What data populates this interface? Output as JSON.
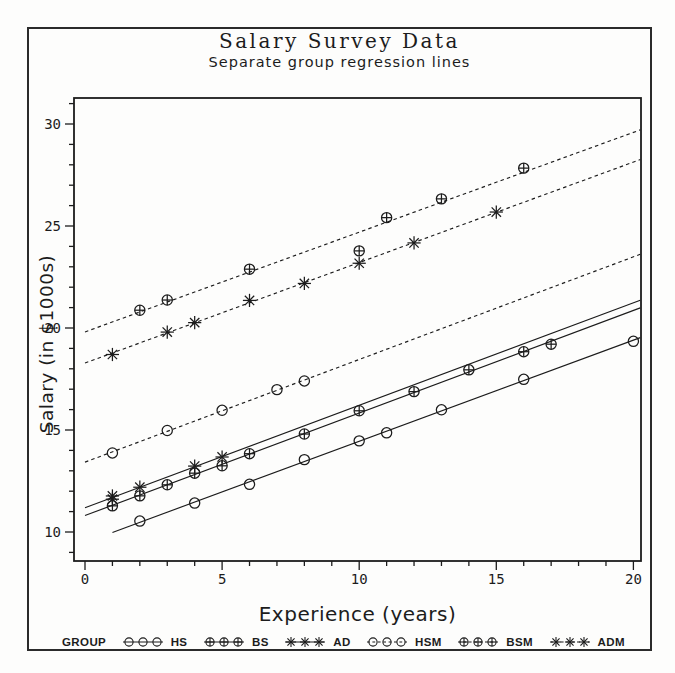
{
  "chart_data": {
    "type": "scatter",
    "title": "Salary Survey Data",
    "subtitle": "Separate group regression lines",
    "xlabel": "Experience (years)",
    "ylabel": "Salary (in $1000s)",
    "xlim": [
      -0.4,
      20.3
    ],
    "ylim": [
      8.6,
      31.3
    ],
    "x_ticks": [
      0,
      5,
      10,
      15,
      20
    ],
    "y_ticks": [
      10,
      15,
      20,
      25,
      30
    ],
    "minor_tick_interval": 1,
    "grid": "off",
    "line_color": "#1c1c1c",
    "series": [
      {
        "name": "HS",
        "marker": "circle",
        "line": "solid",
        "points": [
          [
            2,
            10.535
          ],
          [
            4,
            11.417
          ],
          [
            6,
            12.336
          ],
          [
            8,
            13.548
          ],
          [
            10,
            14.467
          ],
          [
            11,
            14.861
          ],
          [
            13,
            15.99
          ],
          [
            16,
            17.483
          ],
          [
            20,
            19.346
          ]
        ],
        "fit": {
          "intercept": 9.483,
          "slope": 0.4961,
          "x_range": [
            1,
            20.25
          ]
        }
      },
      {
        "name": "BS",
        "marker": "circle-plus",
        "line": "solid",
        "points": [
          [
            1,
            11.283
          ],
          [
            2,
            11.772
          ],
          [
            3,
            12.313
          ],
          [
            4,
            12.884
          ],
          [
            5,
            13.245
          ],
          [
            6,
            13.839
          ],
          [
            8,
            14.803
          ],
          [
            10,
            15.942
          ],
          [
            12,
            16.882
          ],
          [
            14,
            17.949
          ],
          [
            16,
            18.838
          ],
          [
            17,
            19.207
          ]
        ],
        "fit": {
          "intercept": 10.808,
          "slope": 0.5026,
          "x_range": [
            0,
            20.25
          ]
        }
      },
      {
        "name": "AD",
        "marker": "star",
        "line": "solid",
        "points": [
          [
            1,
            11.608
          ],
          [
            1,
            11.767
          ],
          [
            2,
            12.195
          ],
          [
            4,
            13.231
          ],
          [
            5,
            13.677
          ]
        ],
        "fit": {
          "intercept": 11.19,
          "slope": 0.5023,
          "x_range": [
            0,
            20.25
          ]
        }
      },
      {
        "name": "HSM",
        "marker": "circle",
        "line": "dashed",
        "points": [
          [
            1,
            13.876
          ],
          [
            3,
            14.975
          ],
          [
            5,
            15.965
          ],
          [
            7,
            16.978
          ],
          [
            8,
            17.404
          ]
        ],
        "fit": {
          "intercept": 13.425,
          "slope": 0.5031,
          "x_range": [
            0,
            20.25
          ]
        }
      },
      {
        "name": "BSM",
        "marker": "circle-plus",
        "line": "dashed",
        "points": [
          [
            2,
            20.872
          ],
          [
            3,
            21.371
          ],
          [
            6,
            22.884
          ],
          [
            10,
            23.78
          ],
          [
            11,
            25.41
          ],
          [
            13,
            26.33
          ],
          [
            16,
            27.837
          ]
        ],
        "fit": {
          "intercept": 19.807,
          "slope": 0.4891,
          "x_range": [
            0,
            20.25
          ]
        }
      },
      {
        "name": "ADM",
        "marker": "star",
        "line": "dashed",
        "points": [
          [
            1,
            18.701
          ],
          [
            3,
            19.8
          ],
          [
            4,
            20.263
          ],
          [
            6,
            21.352
          ],
          [
            8,
            22.184
          ],
          [
            10,
            23.174
          ],
          [
            12,
            24.17
          ],
          [
            15,
            25.685
          ]
        ],
        "fit": {
          "intercept": 18.283,
          "slope": 0.4925,
          "x_range": [
            0,
            20.25
          ]
        }
      }
    ],
    "legend": {
      "title": "GROUP",
      "position": "bottom",
      "entries": [
        {
          "label": "HS",
          "marker": "circle",
          "line": "solid"
        },
        {
          "label": "BS",
          "marker": "circle-plus",
          "line": "solid"
        },
        {
          "label": "AD",
          "marker": "star",
          "line": "solid"
        },
        {
          "label": "HSM",
          "marker": "circle",
          "line": "dashed"
        },
        {
          "label": "BSM",
          "marker": "circle-plus",
          "line": "dashed"
        },
        {
          "label": "ADM",
          "marker": "star",
          "line": "dashed"
        }
      ]
    }
  }
}
